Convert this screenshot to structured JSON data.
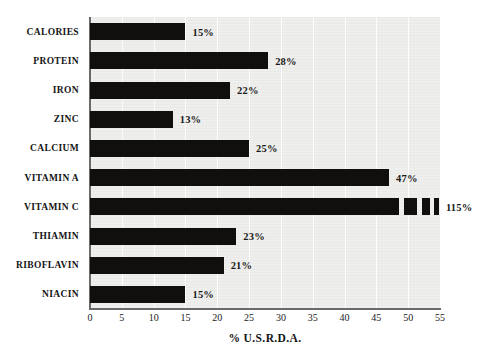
{
  "chart_data": {
    "type": "bar",
    "orientation": "horizontal",
    "title": "",
    "xlabel": "% U.S.R.D.A.",
    "ylabel": "",
    "xlim": [
      0,
      55
    ],
    "xticks": [
      0,
      5,
      10,
      15,
      20,
      25,
      30,
      35,
      40,
      45,
      50,
      55
    ],
    "grid": true,
    "legend": false,
    "bar_color": "#100f0d",
    "plot_background": "#efefed",
    "categories": [
      "CALORIES",
      "PROTEIN",
      "IRON",
      "ZINC",
      "CALCIUM",
      "VITAMIN A",
      "VITAMIN C",
      "THIAMIN",
      "RIBOFLAVIN",
      "NIACIN"
    ],
    "values": [
      15,
      28,
      22,
      13,
      25,
      47,
      115,
      23,
      21,
      15
    ],
    "data_labels": [
      "15%",
      "28%",
      "22%",
      "13%",
      "25%",
      "47%",
      "115%",
      "23%",
      "21%",
      "15%"
    ]
  },
  "bars": [
    {
      "category": "CALORIES",
      "value": 15,
      "label": "15%",
      "truncated": false
    },
    {
      "category": "PROTEIN",
      "value": 28,
      "label": "28%",
      "truncated": false
    },
    {
      "category": "IRON",
      "value": 22,
      "label": "22%",
      "truncated": false
    },
    {
      "category": "ZINC",
      "value": 13,
      "label": "13%",
      "truncated": false
    },
    {
      "category": "CALCIUM",
      "value": 25,
      "label": "25%",
      "truncated": false
    },
    {
      "category": "VITAMIN A",
      "value": 47,
      "label": "47%",
      "truncated": false
    },
    {
      "category": "VITAMIN C",
      "value": 115,
      "label": "115%",
      "truncated": true
    },
    {
      "category": "THIAMIN",
      "value": 23,
      "label": "23%",
      "truncated": false
    },
    {
      "category": "RIBOFLAVIN",
      "value": 21,
      "label": "21%",
      "truncated": false
    },
    {
      "category": "NIACIN",
      "value": 15,
      "label": "15%",
      "truncated": false
    }
  ],
  "axis": {
    "x_title": "% U.S.R.D.A.",
    "x_tick_labels": [
      "0",
      "5",
      "10",
      "15",
      "20",
      "25",
      "30",
      "35",
      "40",
      "45",
      "50",
      "55"
    ]
  }
}
